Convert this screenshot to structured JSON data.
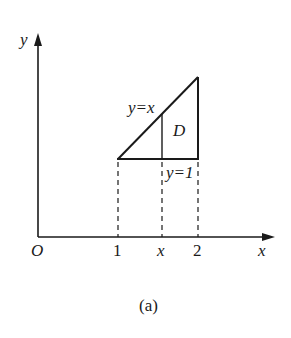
{
  "figure": {
    "caption": "(a)",
    "axes": {
      "x_label": "x",
      "y_label": "y",
      "origin_label": "O"
    },
    "x_ticks": [
      "1",
      "x",
      "2"
    ],
    "labels": {
      "line_diagonal": "y=x",
      "line_horizontal": "y=1",
      "region": "D"
    },
    "colors": {
      "stroke": "#1a1a1a",
      "background": "#ffffff"
    }
  }
}
